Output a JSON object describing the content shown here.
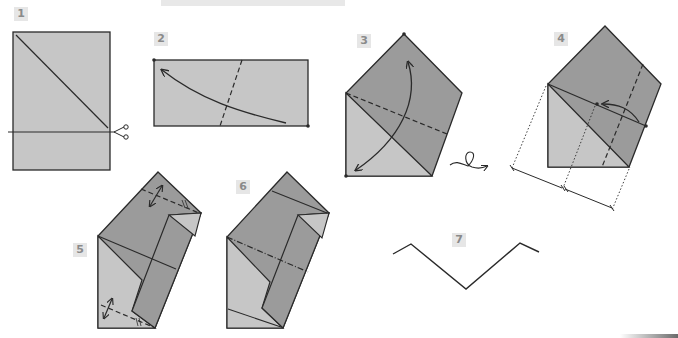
{
  "title_strip": {
    "text": ""
  },
  "steps": [
    {
      "number": "1",
      "description": "Rectangle with diagonal fold line and cut line marked by scissors"
    },
    {
      "number": "2",
      "description": "Rectangle with dashed valley fold and curved arrow"
    },
    {
      "number": "3",
      "description": "Pentagon shape with dashed fold and double-headed arrow, then turn over"
    },
    {
      "number": "4",
      "description": "Pentagon with dashed fold, dotted measurement lines divided in equal parts"
    },
    {
      "number": "5",
      "description": "Folded shape with two dashed folds and double-headed arrows"
    },
    {
      "number": "6",
      "description": "Shape with folded flaps"
    },
    {
      "number": "7",
      "description": "Side profile zigzag outline"
    }
  ],
  "colors": {
    "paper_light": "#c6c6c6",
    "paper_dark": "#9b9b9b",
    "paper_mid": "#b2b2b2",
    "line": "#2a2a2a",
    "label_bg": "#e6e6e6",
    "label_text": "#8a8a8a"
  },
  "icons": {
    "scissors": "✂",
    "turn_over": "turn-over-loop-arrow"
  }
}
